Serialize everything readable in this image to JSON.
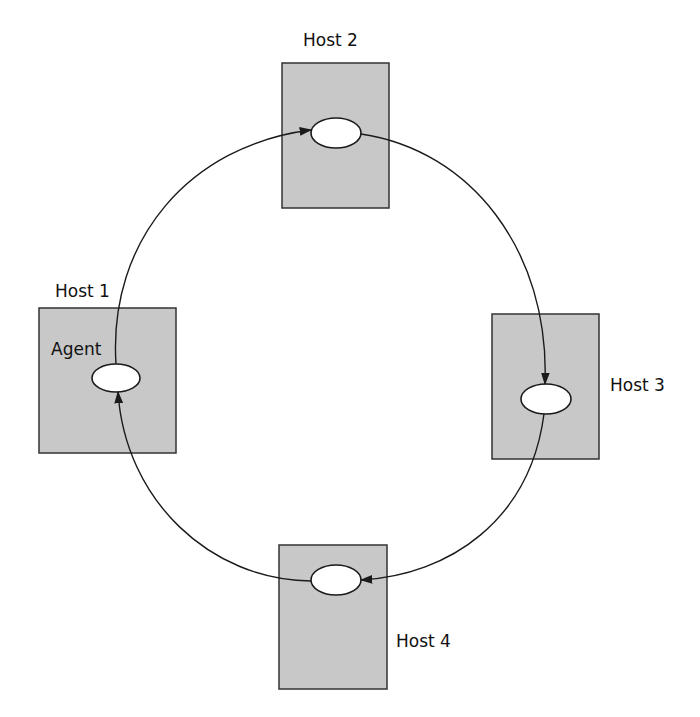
{
  "diagram": {
    "type": "mobile-agent-itinerary",
    "agent_label": "Agent",
    "hosts": [
      {
        "id": "host1",
        "label": "Host 1",
        "has_agent_label": true
      },
      {
        "id": "host2",
        "label": "Host 2"
      },
      {
        "id": "host3",
        "label": "Host 3"
      },
      {
        "id": "host4",
        "label": "Host 4"
      }
    ],
    "edges": [
      {
        "from": "host1",
        "to": "host2",
        "direction": "clockwise"
      },
      {
        "from": "host2",
        "to": "host3",
        "direction": "clockwise"
      },
      {
        "from": "host3",
        "to": "host4",
        "direction": "clockwise"
      },
      {
        "from": "host4",
        "to": "host1",
        "direction": "clockwise"
      }
    ],
    "colors": {
      "host_fill": "#c8c8c8",
      "host_stroke": "#333333",
      "agent_fill": "#ffffff",
      "line": "#1a1a1a"
    }
  }
}
